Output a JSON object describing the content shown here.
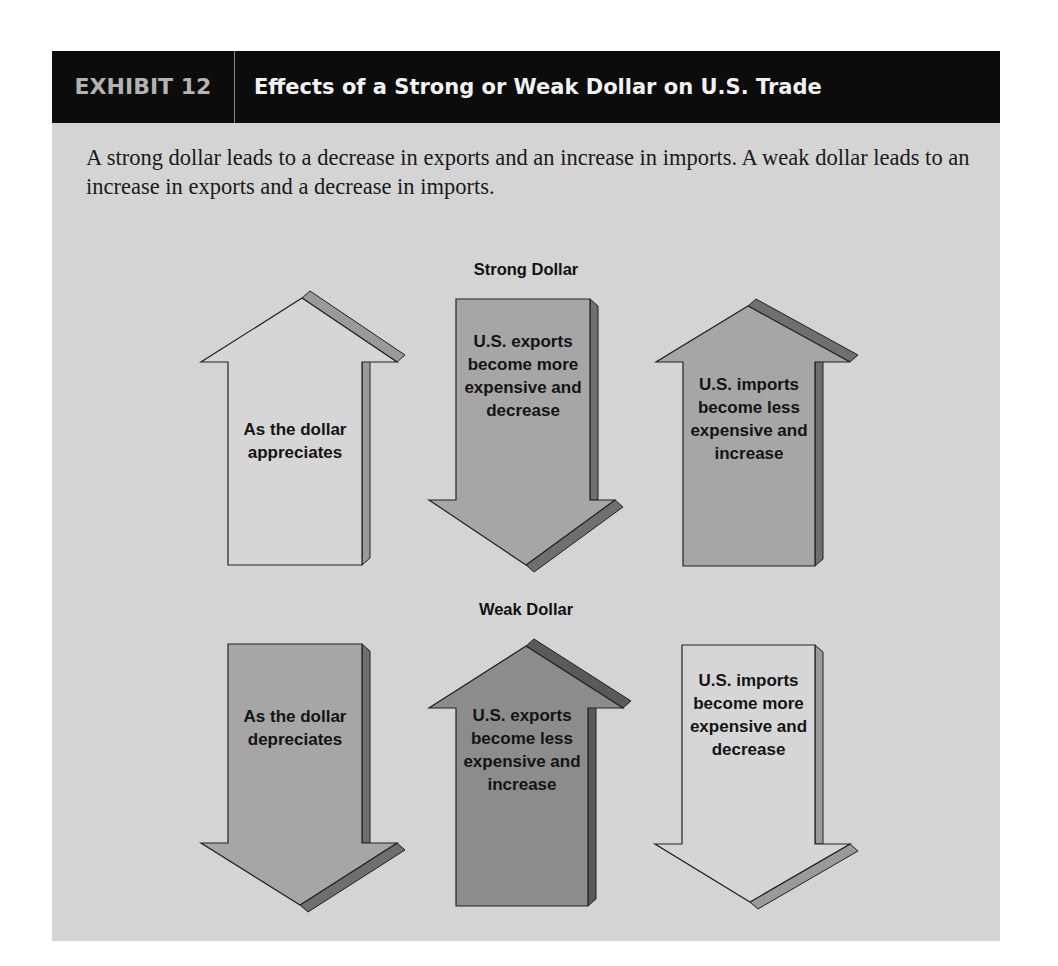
{
  "header": {
    "exhibit_number": "EXHIBIT 12",
    "title": "Effects of a Strong or Weak Dollar on U.S. Trade"
  },
  "description": "A strong dollar leads to a decrease in exports and an increase in imports. A weak dollar leads to an increase in exports and a decrease in imports.",
  "colors": {
    "header_bg": "#0c0c0c",
    "panel_bg": "#d4d4d4",
    "arrow_light": "#d6d6d6",
    "arrow_medium": "#a6a6a6",
    "arrow_dark": "#8c8c8c"
  },
  "sections": [
    {
      "label": "Strong Dollar",
      "arrows": [
        {
          "direction": "up",
          "shade": "light",
          "text": "As the dollar appreciates"
        },
        {
          "direction": "down",
          "shade": "medium",
          "text": "U.S. exports become more expensive and decrease"
        },
        {
          "direction": "up",
          "shade": "medium",
          "text": "U.S. imports become less expensive and increase"
        }
      ]
    },
    {
      "label": "Weak Dollar",
      "arrows": [
        {
          "direction": "down",
          "shade": "medium",
          "text": "As the dollar depreciates"
        },
        {
          "direction": "up",
          "shade": "dark",
          "text": "U.S. exports become less expensive and increase"
        },
        {
          "direction": "down",
          "shade": "light",
          "text": "U.S. imports become more expensive and decrease"
        }
      ]
    }
  ]
}
